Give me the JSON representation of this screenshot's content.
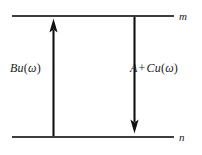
{
  "diagram": {
    "type": "energy-level-diagram",
    "background_color": "#ffffff",
    "line_color": "#3d3d3d",
    "arrow_color": "#111111",
    "levels": [
      {
        "id": "upper",
        "label": "m",
        "y": 16,
        "x_start": 12,
        "x_end": 174,
        "label_x": 179
      },
      {
        "id": "lower",
        "label": "n",
        "y": 137,
        "x_start": 12,
        "x_end": 174,
        "label_x": 179
      }
    ],
    "transitions": [
      {
        "id": "absorption",
        "direction": "up",
        "x": 53,
        "y_from": 137,
        "y_to": 19,
        "label_parts": {
          "coefficient": "B",
          "density": "u",
          "open_paren": "(",
          "omega": "ω",
          "close_paren": ")"
        },
        "label_text": "Bu(ω)"
      },
      {
        "id": "emission",
        "direction": "down",
        "x": 134,
        "y_from": 16,
        "y_to": 133,
        "label_parts": {
          "spontaneous": "A",
          "plus": "+",
          "coefficient": "C",
          "density": "u",
          "open_paren": "(",
          "omega": "ω",
          "close_paren": ")"
        },
        "label_text": "A + Cu(ω)"
      }
    ]
  }
}
